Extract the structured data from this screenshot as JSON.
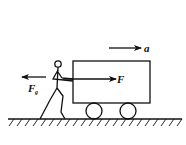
{
  "diagram": {
    "type": "physics-free-body",
    "labels": {
      "acceleration": "a",
      "push_force": "F",
      "friction_force_main": "F",
      "friction_force_sub": "g"
    },
    "colors": {
      "stroke": "#111111",
      "background": "#ffffff"
    },
    "elements": [
      "cart",
      "wheels",
      "person",
      "ground",
      "force-arrows"
    ]
  }
}
